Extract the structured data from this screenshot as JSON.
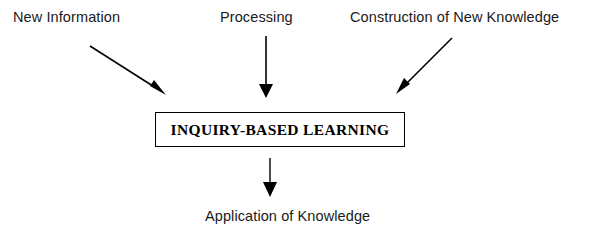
{
  "diagram": {
    "type": "flow-diagram",
    "background_color": "#ffffff",
    "stroke_color": "#000000",
    "text_color": "#1a1a1a",
    "inputs": [
      {
        "id": "new-information",
        "label": "New Information"
      },
      {
        "id": "processing",
        "label": "Processing"
      },
      {
        "id": "construction-of-new-knowledge",
        "label": "Construction of New Knowledge"
      }
    ],
    "center": {
      "id": "inquiry-based-learning",
      "label": "INQUIRY-BASED LEARNING",
      "shape": "rectangle",
      "border_color": "#000000",
      "fill_color": "#ffffff"
    },
    "output": {
      "id": "application-of-knowledge",
      "label": "Application of Knowledge"
    },
    "arrows": [
      {
        "id": "arrow-new-information-to-center",
        "from": "new-information",
        "to": "inquiry-based-learning",
        "direction": "down-right"
      },
      {
        "id": "arrow-processing-to-center",
        "from": "processing",
        "to": "inquiry-based-learning",
        "direction": "down"
      },
      {
        "id": "arrow-construction-to-center",
        "from": "construction-of-new-knowledge",
        "to": "inquiry-based-learning",
        "direction": "down-left"
      },
      {
        "id": "arrow-center-to-application",
        "from": "inquiry-based-learning",
        "to": "application-of-knowledge",
        "direction": "down"
      }
    ]
  }
}
